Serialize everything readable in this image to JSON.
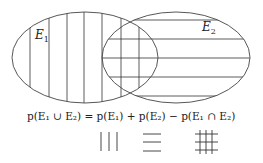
{
  "diagram": {
    "type": "venn",
    "sets": [
      {
        "name": "E1",
        "label_main": "E",
        "label_sub": "1",
        "hatch": "vertical"
      },
      {
        "name": "E2",
        "label_main": "E",
        "label_sub": "2",
        "hatch": "horizontal"
      }
    ],
    "formula": "p(E₁ ∪ E₂) = p(E₁) + p(E₂) − p(E₁ ∩ E₂)",
    "legend": [
      {
        "symbol": "vertical-hatch",
        "meaning": "p(E1)"
      },
      {
        "symbol": "horizontal-hatch",
        "meaning": "p(E2)"
      },
      {
        "symbol": "crosshatch",
        "meaning": "p(E1 ∩ E2)"
      }
    ],
    "colors": {
      "stroke": "#333333",
      "background": "#ffffff"
    }
  }
}
